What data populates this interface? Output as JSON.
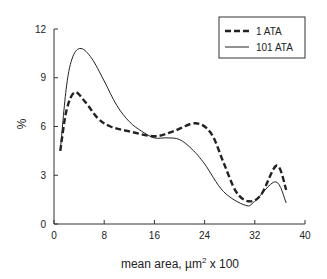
{
  "chart_data": {
    "type": "line",
    "title": "",
    "xlabel": "mean area, µm² x 100",
    "ylabel": "%",
    "xlim": [
      0,
      40
    ],
    "ylim": [
      0,
      12
    ],
    "x_ticks": [
      0,
      8,
      16,
      24,
      32,
      40
    ],
    "y_ticks": [
      0,
      3,
      6,
      9,
      12
    ],
    "grid": false,
    "legend_position": "top-right",
    "series": [
      {
        "name": "1 ATA",
        "style": "dashed",
        "x": [
          1,
          2,
          3.3,
          5,
          7,
          9,
          12,
          16,
          19,
          22.5,
          25,
          27,
          29,
          31,
          33,
          35.5,
          37
        ],
        "y": [
          4.5,
          7.0,
          8.1,
          7.5,
          6.5,
          6.0,
          5.7,
          5.4,
          5.7,
          6.2,
          5.6,
          3.8,
          2.0,
          1.4,
          1.8,
          3.6,
          2.1
        ]
      },
      {
        "name": "101 ATA",
        "style": "solid",
        "x": [
          1,
          2,
          3,
          4.3,
          6,
          8,
          10,
          12,
          14,
          16,
          18,
          20,
          22,
          24,
          27,
          30.5,
          32,
          35.3,
          37
        ],
        "y": [
          4.5,
          8.5,
          10.3,
          10.8,
          10.2,
          8.8,
          7.3,
          6.3,
          5.7,
          5.3,
          5.3,
          5.2,
          4.6,
          3.7,
          2.0,
          1.15,
          1.4,
          2.6,
          1.3
        ]
      }
    ]
  },
  "legend": {
    "items": [
      {
        "label": "1 ATA"
      },
      {
        "label": "101 ATA"
      }
    ]
  },
  "axes": {
    "x_tick_labels": [
      "0",
      "8",
      "16",
      "24",
      "32",
      "40"
    ],
    "y_tick_labels": [
      "0",
      "3",
      "6",
      "9",
      "12"
    ],
    "x_title_prefix": "mean area, µm",
    "x_title_sup": "2",
    "x_title_suffix": " x 100",
    "y_title": "%"
  }
}
